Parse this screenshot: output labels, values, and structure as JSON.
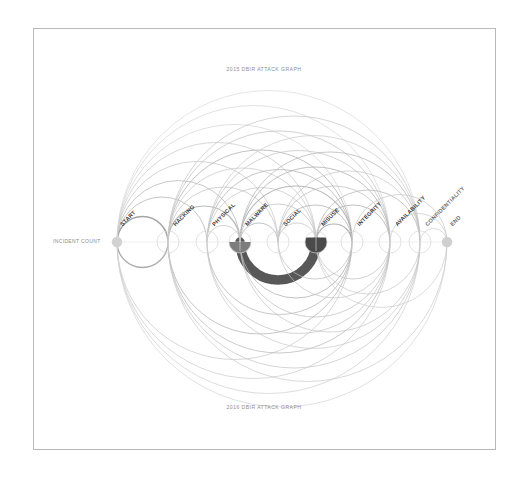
{
  "page": {
    "background_color": "#ffffff",
    "frame_border_color": "#b9b9b9"
  },
  "titles": {
    "top": "2015 DBIR ATTACK GRAPH",
    "bottom": "2016 DBIR ATTACK GRAPH"
  },
  "axis": {
    "label": "INCIDENT COUNT"
  },
  "nodes": [
    {
      "id": "start",
      "label": "START",
      "x": 117,
      "type": "dot",
      "fill": "#d2d2d2"
    },
    {
      "id": "hacking",
      "label": "HACKING",
      "x": 168,
      "type": "circle",
      "fill": "none"
    },
    {
      "id": "physical",
      "label": "PHYSICAL",
      "x": 207,
      "type": "circle",
      "fill": "none"
    },
    {
      "id": "malware",
      "label": "MALWARE",
      "x": 240,
      "type": "circle",
      "fill": "#7d7d7d"
    },
    {
      "id": "social",
      "label": "SOCIAL",
      "x": 278,
      "type": "circle",
      "fill": "none"
    },
    {
      "id": "misuse",
      "label": "MISUSE",
      "x": 316,
      "type": "circle",
      "fill": "#4a4a4a"
    },
    {
      "id": "integrity",
      "label": "INTEGRITY",
      "x": 352,
      "type": "circle",
      "fill": "none"
    },
    {
      "id": "availability",
      "label": "AVAILABILITY",
      "x": 390,
      "type": "circle",
      "fill": "none"
    },
    {
      "id": "confidentiality",
      "label": "CONFIDENTIALITY",
      "x": 420,
      "type": "circle",
      "fill": "none"
    },
    {
      "id": "end",
      "label": "END",
      "x": 447,
      "type": "dot",
      "fill": "#d0d0d0"
    }
  ],
  "chart_data": {
    "type": "arc-diagram",
    "title": "2015 DBIR ATTACK GRAPH",
    "subtitle": "2016 DBIR ATTACK GRAPH",
    "axis_label": "INCIDENT COUNT",
    "baseline_y": 242,
    "node_radius": 11,
    "categories": [
      "START",
      "HACKING",
      "PHYSICAL",
      "MALWARE",
      "SOCIAL",
      "MISUSE",
      "INTEGRITY",
      "AVAILABILITY",
      "CONFIDENTIALITY",
      "END"
    ],
    "node_x": [
      117,
      168,
      207,
      240,
      278,
      316,
      352,
      390,
      420,
      447
    ],
    "node_fill_fraction": [
      0,
      0,
      0,
      0.5,
      0,
      0.7,
      0,
      0,
      0,
      0
    ],
    "grid": false,
    "legend": "none",
    "edges": [
      {
        "source": "start",
        "target": "hacking",
        "side": "up",
        "weight": 1.6,
        "color": "#8e8e8e"
      },
      {
        "source": "start",
        "target": "physical",
        "side": "up",
        "weight": 1.0,
        "color": "#b8b8b8"
      },
      {
        "source": "start",
        "target": "malware",
        "side": "up",
        "weight": 1.0,
        "color": "#bcbcbc"
      },
      {
        "source": "start",
        "target": "social",
        "side": "up",
        "weight": 0.9,
        "color": "#c4c4c4"
      },
      {
        "source": "start",
        "target": "misuse",
        "side": "up",
        "weight": 0.9,
        "color": "#c8c8c8"
      },
      {
        "source": "start",
        "target": "integrity",
        "side": "up",
        "weight": 0.8,
        "color": "#cfcfcf"
      },
      {
        "source": "start",
        "target": "availability",
        "side": "up",
        "weight": 0.8,
        "color": "#d2d2d2"
      },
      {
        "source": "start",
        "target": "confidentiality",
        "side": "up",
        "weight": 0.8,
        "color": "#d6d6d6"
      },
      {
        "source": "hacking",
        "target": "malware",
        "side": "up",
        "weight": 1.2,
        "color": "#a9a9a9"
      },
      {
        "source": "hacking",
        "target": "social",
        "side": "up",
        "weight": 0.9,
        "color": "#c2c2c2"
      },
      {
        "source": "hacking",
        "target": "misuse",
        "side": "up",
        "weight": 0.9,
        "color": "#c6c6c6"
      },
      {
        "source": "hacking",
        "target": "integrity",
        "side": "up",
        "weight": 1.0,
        "color": "#b4b4b4"
      },
      {
        "source": "hacking",
        "target": "availability",
        "side": "up",
        "weight": 0.9,
        "color": "#c0c0c0"
      },
      {
        "source": "hacking",
        "target": "confidentiality",
        "side": "up",
        "weight": 0.9,
        "color": "#c6c6c6"
      },
      {
        "source": "physical",
        "target": "malware",
        "side": "up",
        "weight": 0.9,
        "color": "#c0c0c0"
      },
      {
        "source": "physical",
        "target": "misuse",
        "side": "up",
        "weight": 0.9,
        "color": "#c4c4c4"
      },
      {
        "source": "physical",
        "target": "integrity",
        "side": "up",
        "weight": 1.0,
        "color": "#b6b6b6"
      },
      {
        "source": "physical",
        "target": "availability",
        "side": "up",
        "weight": 0.9,
        "color": "#c2c2c2"
      },
      {
        "source": "physical",
        "target": "confidentiality",
        "side": "up",
        "weight": 0.9,
        "color": "#c8c8c8"
      },
      {
        "source": "malware",
        "target": "social",
        "side": "up",
        "weight": 1.0,
        "color": "#b0b0b0"
      },
      {
        "source": "malware",
        "target": "misuse",
        "side": "up",
        "weight": 0.9,
        "color": "#bebebe"
      },
      {
        "source": "malware",
        "target": "integrity",
        "side": "up",
        "weight": 1.1,
        "color": "#a6a6a6"
      },
      {
        "source": "malware",
        "target": "availability",
        "side": "up",
        "weight": 1.0,
        "color": "#b2b2b2"
      },
      {
        "source": "malware",
        "target": "confidentiality",
        "side": "up",
        "weight": 1.0,
        "color": "#bababa"
      },
      {
        "source": "social",
        "target": "misuse",
        "side": "up",
        "weight": 0.9,
        "color": "#c0c0c0"
      },
      {
        "source": "social",
        "target": "integrity",
        "side": "up",
        "weight": 1.0,
        "color": "#b4b4b4"
      },
      {
        "source": "social",
        "target": "availability",
        "side": "up",
        "weight": 0.9,
        "color": "#bcbcbc"
      },
      {
        "source": "social",
        "target": "confidentiality",
        "side": "up",
        "weight": 0.9,
        "color": "#c4c4c4"
      },
      {
        "source": "misuse",
        "target": "integrity",
        "side": "up",
        "weight": 1.2,
        "color": "#9e9e9e"
      },
      {
        "source": "misuse",
        "target": "availability",
        "side": "up",
        "weight": 1.0,
        "color": "#b0b0b0"
      },
      {
        "source": "misuse",
        "target": "confidentiality",
        "side": "up",
        "weight": 1.0,
        "color": "#bababa"
      },
      {
        "source": "integrity",
        "target": "end",
        "side": "up",
        "weight": 0.9,
        "color": "#c6c6c6"
      },
      {
        "source": "availability",
        "target": "end",
        "side": "up",
        "weight": 0.9,
        "color": "#cacaca"
      },
      {
        "source": "confidentiality",
        "target": "end",
        "side": "up",
        "weight": 0.9,
        "color": "#cecece"
      },
      {
        "source": "malware",
        "target": "misuse",
        "side": "down",
        "weight": 9.5,
        "color": "#4f4f4f"
      },
      {
        "source": "start",
        "target": "hacking",
        "side": "down",
        "weight": 1.4,
        "color": "#9a9a9a"
      },
      {
        "source": "start",
        "target": "integrity",
        "side": "down",
        "weight": 0.9,
        "color": "#c8c8c8"
      },
      {
        "source": "start",
        "target": "availability",
        "side": "down",
        "weight": 0.9,
        "color": "#cccccc"
      },
      {
        "source": "start",
        "target": "confidentiality",
        "side": "down",
        "weight": 0.9,
        "color": "#d0d0d0"
      },
      {
        "source": "start",
        "target": "end",
        "side": "down",
        "weight": 0.9,
        "color": "#d4d4d4"
      },
      {
        "source": "hacking",
        "target": "integrity",
        "side": "down",
        "weight": 1.0,
        "color": "#b8b8b8"
      },
      {
        "source": "hacking",
        "target": "availability",
        "side": "down",
        "weight": 1.0,
        "color": "#bebebe"
      },
      {
        "source": "hacking",
        "target": "confidentiality",
        "side": "down",
        "weight": 0.9,
        "color": "#c4c4c4"
      },
      {
        "source": "hacking",
        "target": "end",
        "side": "down",
        "weight": 0.9,
        "color": "#cacaca"
      },
      {
        "source": "physical",
        "target": "integrity",
        "side": "down",
        "weight": 1.0,
        "color": "#bababa"
      },
      {
        "source": "physical",
        "target": "availability",
        "side": "down",
        "weight": 0.9,
        "color": "#c2c2c2"
      },
      {
        "source": "physical",
        "target": "confidentiality",
        "side": "down",
        "weight": 0.9,
        "color": "#c8c8c8"
      },
      {
        "source": "malware",
        "target": "integrity",
        "side": "down",
        "weight": 1.0,
        "color": "#b4b4b4"
      },
      {
        "source": "malware",
        "target": "availability",
        "side": "down",
        "weight": 0.9,
        "color": "#bebebe"
      },
      {
        "source": "malware",
        "target": "confidentiality",
        "side": "down",
        "weight": 0.9,
        "color": "#c6c6c6"
      },
      {
        "source": "social",
        "target": "integrity",
        "side": "down",
        "weight": 0.9,
        "color": "#bcbcbc"
      },
      {
        "source": "social",
        "target": "availability",
        "side": "down",
        "weight": 0.9,
        "color": "#c4c4c4"
      },
      {
        "source": "misuse",
        "target": "availability",
        "side": "down",
        "weight": 0.9,
        "color": "#c0c0c0"
      },
      {
        "source": "misuse",
        "target": "confidentiality",
        "side": "down",
        "weight": 0.9,
        "color": "#c8c8c8"
      },
      {
        "source": "misuse",
        "target": "end",
        "side": "down",
        "weight": 0.9,
        "color": "#cecece"
      }
    ]
  }
}
